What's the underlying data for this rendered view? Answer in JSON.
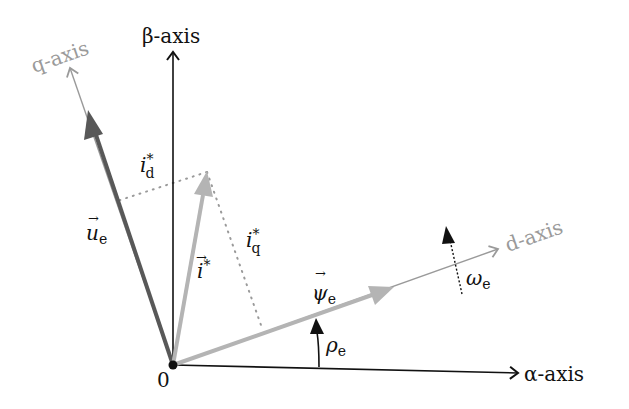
{
  "diagram": {
    "type": "vector-diagram",
    "origin": {
      "label": "0",
      "x": 173,
      "y": 365
    },
    "colors": {
      "fixed_axes": "#111111",
      "rotating_axes": "#9a9a9a",
      "voltage_vector": "#585858",
      "current_vector": "#b4b4b4",
      "flux_vector": "#b4b4b4",
      "projection_dots": "#9a9a9a"
    },
    "axes": {
      "alpha": {
        "label": "α-axis",
        "end": [
          520,
          373
        ]
      },
      "beta": {
        "label": "β-axis",
        "end": [
          173,
          50
        ]
      },
      "d": {
        "label": "d-axis",
        "end": [
          500,
          248
        ]
      },
      "q": {
        "label": "q-axis",
        "end": [
          69,
          66
        ]
      }
    },
    "vectors": {
      "u_e": {
        "symbol": "u",
        "subscript": "e",
        "arrow": "→",
        "end": [
          88,
          110
        ]
      },
      "i_ref": {
        "symbol": "i",
        "superscript": "*",
        "arrow": "→",
        "end": [
          207,
          172
        ]
      },
      "psi_e": {
        "symbol": "ψ",
        "subscript": "e",
        "arrow": "→",
        "end": [
          392,
          288
        ]
      }
    },
    "projections": {
      "i_d": {
        "symbol": "i",
        "subscript": "d",
        "superscript": "*"
      },
      "i_q": {
        "symbol": "i",
        "subscript": "q",
        "superscript": "*"
      }
    },
    "angles": {
      "rho_e": {
        "symbol": "ρ",
        "subscript": "e"
      },
      "omega_e": {
        "symbol": "ω",
        "subscript": "e"
      }
    }
  }
}
